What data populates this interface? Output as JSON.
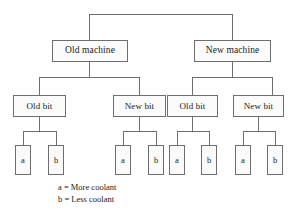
{
  "diagram": {
    "type": "tree",
    "title": "",
    "root": {
      "name": "root-branch",
      "label": ""
    },
    "levels": [
      {
        "level": 1,
        "name": "machine-level",
        "nodes": [
          {
            "id": "old-machine",
            "label": "Old machine"
          },
          {
            "id": "new-machine",
            "label": "New machine"
          }
        ]
      },
      {
        "level": 2,
        "name": "bit-level",
        "nodes": [
          {
            "id": "old-machine-old-bit",
            "label": "Old bit",
            "parent": "old-machine"
          },
          {
            "id": "old-machine-new-bit",
            "label": "New bit",
            "parent": "old-machine"
          },
          {
            "id": "new-machine-old-bit",
            "label": "Old bit",
            "parent": "new-machine"
          },
          {
            "id": "new-machine-new-bit",
            "label": "New bit",
            "parent": "new-machine"
          }
        ]
      },
      {
        "level": 3,
        "name": "coolant-level",
        "nodes": [
          {
            "id": "leaf-1a",
            "label": "a",
            "parent": "old-machine-old-bit"
          },
          {
            "id": "leaf-1b",
            "label": "b",
            "parent": "old-machine-old-bit"
          },
          {
            "id": "leaf-2a",
            "label": "a",
            "parent": "old-machine-new-bit"
          },
          {
            "id": "leaf-2b",
            "label": "b",
            "parent": "old-machine-new-bit"
          },
          {
            "id": "leaf-3a",
            "label": "a",
            "parent": "new-machine-old-bit"
          },
          {
            "id": "leaf-3b",
            "label": "b",
            "parent": "new-machine-old-bit"
          },
          {
            "id": "leaf-4a",
            "label": "a",
            "parent": "new-machine-new-bit"
          },
          {
            "id": "leaf-4b",
            "label": "b",
            "parent": "new-machine-new-bit"
          }
        ]
      }
    ]
  },
  "legend": {
    "name": "coolant-legend",
    "entries": [
      {
        "key": "a",
        "text": "a = More coolant"
      },
      {
        "key": "b",
        "text": "b = Less coolant"
      }
    ]
  },
  "colors": {
    "background": "#ffffff",
    "line": "#6e6e6e",
    "box_border": "#6e6e6e",
    "box_fill": "#fbfbfb",
    "text": "#222222"
  }
}
